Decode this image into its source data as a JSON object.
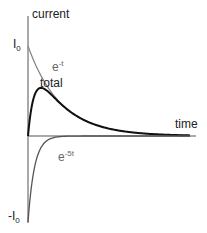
{
  "chart_data": {
    "type": "line",
    "title": "",
    "xlabel": "time",
    "ylabel": "current",
    "y_ticks": [
      {
        "label": "I0",
        "value": 1
      },
      {
        "label": "-I0",
        "value": -1
      }
    ],
    "grid": false,
    "legend": "inline annotations",
    "series": [
      {
        "name": "e^-t",
        "label": "e-t",
        "color": "#808080",
        "formula": "I0*exp(-t)"
      },
      {
        "name": "total",
        "label": "total",
        "color": "#111111",
        "formula": "I0*(exp(-t)-exp(-5t))"
      },
      {
        "name": "e^-5t",
        "label": "e-5t",
        "color": "#555555",
        "formula": "-I0*exp(-5t)"
      }
    ],
    "x_range": [
      0,
      5
    ],
    "y_range": [
      -1,
      1
    ]
  },
  "labels": {
    "ylabel": "current",
    "xlabel": "time",
    "i0_main": "I",
    "i0_sub": "0",
    "neg_i0_main": "-I",
    "neg_i0_sub": "0",
    "et_base": "e",
    "et_exp": "-t",
    "total": "total",
    "e5t_base": "e",
    "e5t_exp": "-5t"
  },
  "colors": {
    "axis": "#555555",
    "e_t": "#808080",
    "total": "#111111",
    "e_5t": "#555555"
  }
}
